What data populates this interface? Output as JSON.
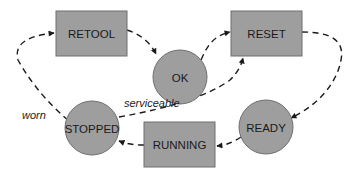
{
  "diagram": {
    "type": "state-transition",
    "colors": {
      "node_fill": "#9e9e9e",
      "node_stroke": "#6e6e6e",
      "edge": "#1a1a1a",
      "background": "#ffffff"
    },
    "nodes": [
      {
        "id": "retool",
        "label": "RETOOL",
        "shape": "rectangle"
      },
      {
        "id": "ok",
        "label": "OK",
        "shape": "circle"
      },
      {
        "id": "reset",
        "label": "RESET",
        "shape": "rectangle"
      },
      {
        "id": "ready",
        "label": "READY",
        "shape": "circle"
      },
      {
        "id": "running",
        "label": "RUNNING",
        "shape": "rectangle"
      },
      {
        "id": "stopped",
        "label": "STOPPED",
        "shape": "circle"
      }
    ],
    "edges": [
      {
        "from": "retool",
        "to": "ok",
        "label": ""
      },
      {
        "from": "ok",
        "to": "reset",
        "label": ""
      },
      {
        "from": "reset",
        "to": "ready",
        "label": ""
      },
      {
        "from": "ready",
        "to": "running",
        "label": ""
      },
      {
        "from": "running",
        "to": "stopped",
        "label": ""
      },
      {
        "from": "stopped",
        "to": "retool",
        "label": "worn"
      },
      {
        "from": "stopped",
        "to": "reset",
        "label": "serviceable"
      }
    ],
    "edge_labels": {
      "worn": "worn",
      "serviceable": "serviceable"
    }
  }
}
